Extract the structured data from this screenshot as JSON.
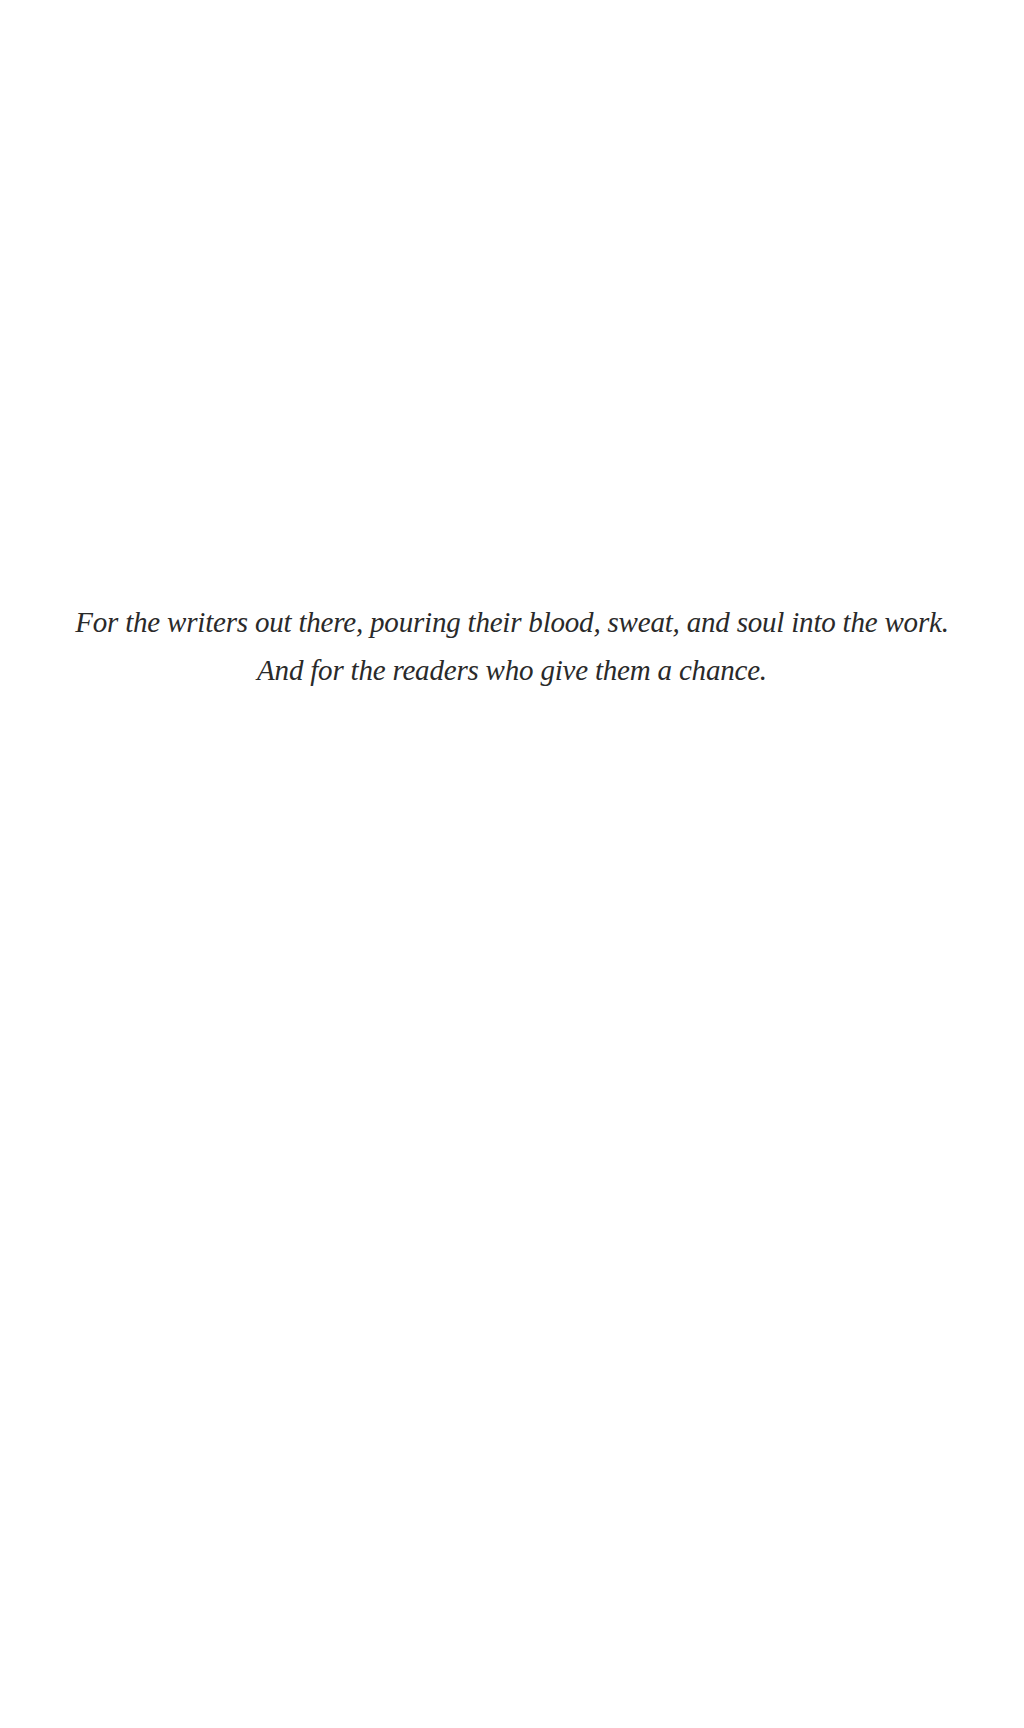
{
  "page": {
    "type": "dedication",
    "background": "#ffffff",
    "text_color": "#2a2a2a"
  },
  "dedication": {
    "lines": [
      "For the writers out there, pouring their blood, sweat, and soul into the work.",
      "And for the readers who give them a chance."
    ]
  }
}
